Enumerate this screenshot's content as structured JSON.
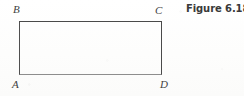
{
  "figure": {
    "caption": "Figure 6.18",
    "shape": {
      "kind": "rectangle",
      "vertices": [
        {
          "id": "A",
          "label": "A",
          "position": "bottom-left"
        },
        {
          "id": "B",
          "label": "B",
          "position": "top-left"
        },
        {
          "id": "C",
          "label": "C",
          "position": "top-right"
        },
        {
          "id": "D",
          "label": "D",
          "position": "bottom-right"
        }
      ]
    },
    "colors": {
      "page_background": "#fefefe",
      "stroke": "#4a4a4a",
      "stroke_bottom": "#8d8d8d",
      "label_text": "#3f3f3f",
      "caption_text": "#3a3a3a"
    }
  }
}
